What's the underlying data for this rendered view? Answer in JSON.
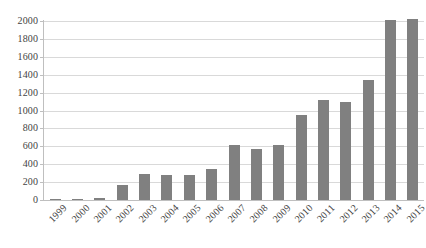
{
  "chart_data": {
    "type": "bar",
    "title": "",
    "subtitle": "",
    "xlabel": "",
    "ylabel": "",
    "categories": [
      "1999",
      "2000",
      "2001",
      "2002",
      "2003",
      "2004",
      "2005",
      "2006",
      "2007",
      "2008",
      "2009",
      "2010",
      "2011",
      "2012",
      "2013",
      "2014",
      "2015"
    ],
    "values": [
      10,
      10,
      25,
      170,
      290,
      285,
      285,
      350,
      620,
      575,
      620,
      950,
      1120,
      1100,
      1340,
      2010,
      2020
    ],
    "series": [
      {
        "name": "",
        "values": [
          10,
          10,
          25,
          170,
          290,
          285,
          285,
          350,
          620,
          575,
          620,
          950,
          1120,
          1100,
          1340,
          2010,
          2020
        ]
      }
    ],
    "ylim": [
      0,
      2000
    ],
    "y_ticks": [
      0,
      200,
      400,
      600,
      800,
      1000,
      1200,
      1400,
      1600,
      1800,
      2000
    ],
    "y_tick_labels": [
      "0",
      "200",
      "400",
      "600",
      "800",
      "1000",
      "1200",
      "1400",
      "1600",
      "1800",
      "2000"
    ],
    "grid": true,
    "grid_axis": "y",
    "legend": false,
    "legend_position": "none",
    "annotations": [],
    "bar_color": "#808080",
    "gridline_color": "#d9d9d9",
    "axis_color": "#bfbfbf",
    "text_color": "#434343",
    "background_color": "#ffffff",
    "x_label_rotation": -45
  }
}
